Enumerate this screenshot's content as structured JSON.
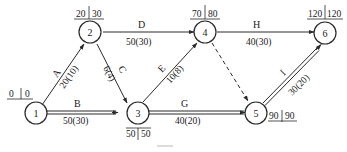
{
  "diagram": {
    "type": "activity-on-arrow network",
    "nodes": [
      {
        "id": "1",
        "label": "1",
        "es": "0",
        "ls": "0"
      },
      {
        "id": "2",
        "label": "2",
        "es": "20",
        "ls": "30"
      },
      {
        "id": "3",
        "label": "3",
        "es": "50",
        "ls": "50"
      },
      {
        "id": "4",
        "label": "4",
        "es": "70",
        "ls": "80"
      },
      {
        "id": "5",
        "label": "5",
        "es": "90",
        "ls": "90"
      },
      {
        "id": "6",
        "label": "6",
        "es": "120",
        "ls": "120"
      }
    ],
    "activities": [
      {
        "name": "A",
        "from": "1",
        "to": "2",
        "duration": "20(10)",
        "critical": false
      },
      {
        "name": "B",
        "from": "1",
        "to": "3",
        "duration": "50(30)",
        "critical": true
      },
      {
        "name": "C",
        "from": "2",
        "to": "3",
        "duration": "6(4)",
        "critical": false
      },
      {
        "name": "D",
        "from": "2",
        "to": "4",
        "duration": "50(30)",
        "critical": false
      },
      {
        "name": "E",
        "from": "3",
        "to": "4",
        "duration": "10(8)",
        "critical": false
      },
      {
        "name": "G",
        "from": "3",
        "to": "5",
        "duration": "40(20)",
        "critical": true
      },
      {
        "name": "H",
        "from": "4",
        "to": "6",
        "duration": "40(30)",
        "critical": false
      },
      {
        "name": "I",
        "from": "5",
        "to": "6",
        "duration": "30(20)",
        "critical": true
      }
    ],
    "dummy": {
      "from": "4",
      "to": "5",
      "style": "dashed"
    },
    "colors": {
      "line": "#2a2a2a",
      "background": "#ffffff",
      "caption": "#c8c8c8"
    }
  }
}
